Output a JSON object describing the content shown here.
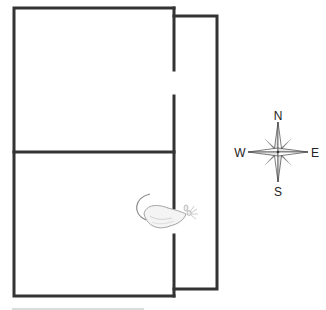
{
  "diagram": {
    "type": "maze-floorplan",
    "colors": {
      "wall": "#333333",
      "background": "#ffffff",
      "compass_dark": "#333333",
      "compass_light": "#e6e6e6"
    },
    "rooms": [
      {
        "name": "upper-room"
      },
      {
        "name": "lower-room"
      },
      {
        "name": "east-corridor"
      }
    ],
    "doorways": [
      {
        "name": "upper-doorway",
        "wall": "east"
      },
      {
        "name": "lower-doorway",
        "wall": "east",
        "occupied_by": "rat"
      }
    ],
    "figure": {
      "name": "rat",
      "facing": "east"
    }
  },
  "compass": {
    "north": "N",
    "south": "S",
    "east": "E",
    "west": "W"
  }
}
